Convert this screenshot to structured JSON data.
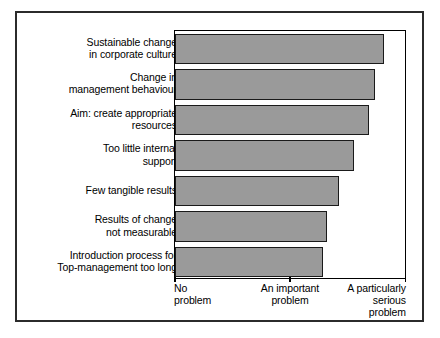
{
  "chart_data": {
    "type": "bar",
    "orientation": "horizontal",
    "title": "",
    "xlabel": "",
    "ylabel": "",
    "grid": false,
    "legend": null,
    "xlim": [
      0,
      2
    ],
    "xtick_values": [
      0,
      1,
      2
    ],
    "xtick_labels": [
      "No\nproblem",
      "An important\nproblem",
      "A particularly\nserious\nproblem"
    ],
    "categories": [
      "Sustainable change\nin corporate culture",
      "Change in\nmanagement behaviour",
      "Aim: create appropriate\nresources",
      "Too little internal\nsupport",
      "Few tangible results",
      "Results of change\nnot measurable",
      "Introduction process for\nTop-management too long"
    ],
    "values": [
      1.8,
      1.72,
      1.67,
      1.54,
      1.41,
      1.31,
      1.28
    ],
    "bar_color": "#9a9a9a",
    "bar_edge_color": "#1a1a1a",
    "frame_color": "#000000",
    "background_color": "#ffffff"
  }
}
